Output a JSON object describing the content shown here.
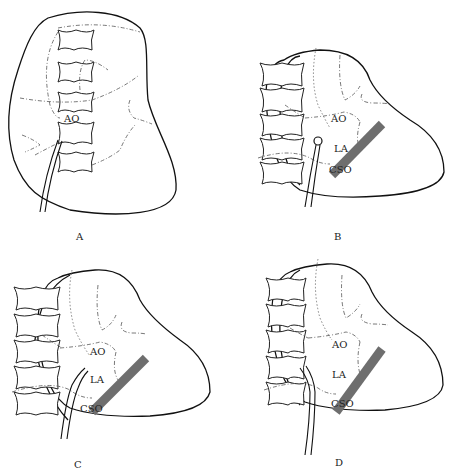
{
  "figure": {
    "panels": [
      {
        "id": "A",
        "label": "A",
        "structures": [
          "AO"
        ]
      },
      {
        "id": "B",
        "label": "B",
        "structures": [
          "AO",
          "LA",
          "CSO"
        ]
      },
      {
        "id": "C",
        "label": "C",
        "structures": [
          "AO",
          "LA",
          "CSO"
        ]
      },
      {
        "id": "D",
        "label": "D",
        "structures": [
          "AO",
          "LA",
          "CSO"
        ]
      }
    ],
    "labels": {
      "ao": "AO",
      "la": "LA",
      "cso": "CSO"
    },
    "colors": {
      "outline": "#111111",
      "band": "#6e6e6e",
      "background": "#ffffff"
    }
  }
}
